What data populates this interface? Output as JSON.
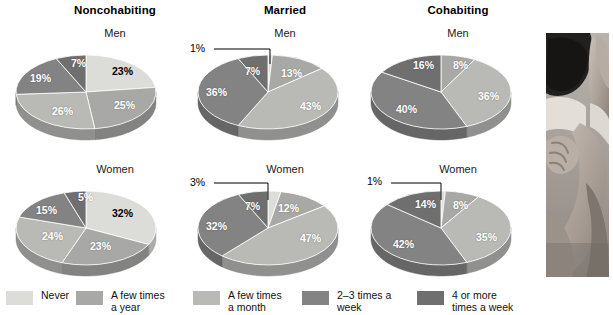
{
  "figure": {
    "columns": [
      "Noncohabiting",
      "Married",
      "Cohabiting"
    ],
    "row_labels": [
      "Men",
      "Women"
    ]
  },
  "legend": {
    "items": [
      {
        "label": "Never",
        "color": "#dcdcd8"
      },
      {
        "label": "A few times\na year",
        "color": "#a8a8a6"
      },
      {
        "label": "A few times\na month",
        "color": "#b9b9b6"
      },
      {
        "label": "2–3 times  a\nweek",
        "color": "#838383"
      },
      {
        "label": "4 or more\ntimes a week",
        "color": "#6f6f6f"
      }
    ]
  },
  "chart_data": [
    {
      "type": "pie",
      "title": "Noncohabiting",
      "subtitle": "Men",
      "categories": [
        "Never",
        "A few times a year",
        "A few times a month",
        "2–3 times a week",
        "4 or more times a week"
      ],
      "values": [
        23,
        25,
        26,
        19,
        7
      ],
      "labels": [
        "23%",
        "25%",
        "26%",
        "19%",
        "7%"
      ]
    },
    {
      "type": "pie",
      "title": "Married",
      "subtitle": "Men",
      "categories": [
        "Never",
        "A few times a year",
        "A few times a month",
        "2–3 times a week",
        "4 or more times a week"
      ],
      "values": [
        1,
        13,
        43,
        36,
        7
      ],
      "labels": [
        "1%",
        "13%",
        "43%",
        "36%",
        "7%"
      ]
    },
    {
      "type": "pie",
      "title": "Cohabiting",
      "subtitle": "Men",
      "categories": [
        "Never",
        "A few times a year",
        "A few times a month",
        "2–3 times a week",
        "4 or more times a week"
      ],
      "values": [
        0,
        8,
        36,
        40,
        16
      ],
      "labels": [
        "",
        "8%",
        "36%",
        "40%",
        "16%"
      ]
    },
    {
      "type": "pie",
      "title": "Noncohabiting",
      "subtitle": "Women",
      "categories": [
        "Never",
        "A few times a year",
        "A few times a month",
        "2–3 times a week",
        "4 or more times a week"
      ],
      "values": [
        32,
        23,
        24,
        15,
        5
      ],
      "labels": [
        "32%",
        "23%",
        "24%",
        "15%",
        "5%"
      ]
    },
    {
      "type": "pie",
      "title": "Married",
      "subtitle": "Women",
      "categories": [
        "Never",
        "A few times a year",
        "A few times a month",
        "2–3 times a week",
        "4 or more times a week"
      ],
      "values": [
        3,
        12,
        47,
        32,
        7
      ],
      "labels": [
        "3%",
        "12%",
        "47%",
        "32%",
        "7%"
      ]
    },
    {
      "type": "pie",
      "title": "Cohabiting",
      "subtitle": "Women",
      "categories": [
        "Never",
        "A few times a year",
        "A few times a month",
        "2–3 times a week",
        "4 or more times a week"
      ],
      "values": [
        1,
        8,
        35,
        42,
        14
      ],
      "labels": [
        "1%",
        "8%",
        "35%",
        "42%",
        "14%"
      ]
    }
  ],
  "charts": {
    "nc_men": {
      "l_never": "23%",
      "l_year": "25%",
      "l_month": "26%",
      "l_week23": "19%",
      "l_week4": "7%"
    },
    "m_men": {
      "l_never": "1%",
      "l_year": "13%",
      "l_month": "43%",
      "l_week23": "36%",
      "l_week4": "7%"
    },
    "c_men": {
      "l_year": "8%",
      "l_month": "36%",
      "l_week23": "40%",
      "l_week4": "16%"
    },
    "nc_women": {
      "l_never": "32%",
      "l_year": "23%",
      "l_month": "24%",
      "l_week23": "15%",
      "l_week4": "5%"
    },
    "m_women": {
      "l_never": "3%",
      "l_year": "12%",
      "l_month": "47%",
      "l_week23": "32%",
      "l_week4": "7%"
    },
    "c_women": {
      "l_never": "1%",
      "l_year": "8%",
      "l_month": "35%",
      "l_week23": "42%",
      "l_week4": "14%"
    }
  },
  "titles": {
    "noncohabiting": "Noncohabiting",
    "married": "Married",
    "cohabiting": "Cohabiting",
    "men": "Men",
    "women": "Women"
  },
  "photo": {
    "alt": "couple-embracing-photo"
  }
}
